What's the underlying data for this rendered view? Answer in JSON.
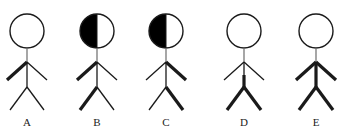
{
  "diagram": {
    "colors": {
      "stroke": "#1a1a1a",
      "neck": "#777777",
      "head_fill_shaded": "#000000",
      "head_fill_plain": "#ffffff",
      "background": "#ffffff"
    },
    "figures": [
      {
        "label": "A",
        "cx": 27,
        "head_shaded": "none",
        "thick": {
          "left_arm": true,
          "right_arm": false,
          "upper_torso": false,
          "lower_torso": false,
          "left_leg": false,
          "right_leg": false
        }
      },
      {
        "label": "B",
        "cx": 97,
        "head_shaded": "left",
        "thick": {
          "left_arm": true,
          "right_arm": false,
          "upper_torso": false,
          "lower_torso": false,
          "left_leg": true,
          "right_leg": false
        }
      },
      {
        "label": "C",
        "cx": 166,
        "head_shaded": "left",
        "thick": {
          "left_arm": false,
          "right_arm": true,
          "upper_torso": false,
          "lower_torso": false,
          "left_leg": false,
          "right_leg": true
        }
      },
      {
        "label": "D",
        "cx": 244,
        "head_shaded": "none",
        "thick": {
          "left_arm": false,
          "right_arm": false,
          "upper_torso": false,
          "lower_torso": true,
          "left_leg": true,
          "right_leg": true
        }
      },
      {
        "label": "E",
        "cx": 316,
        "head_shaded": "none",
        "thick": {
          "left_arm": true,
          "right_arm": true,
          "upper_torso": true,
          "lower_torso": true,
          "left_leg": true,
          "right_leg": true
        }
      }
    ]
  }
}
